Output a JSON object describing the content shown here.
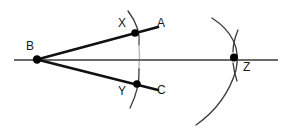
{
  "diagram": {
    "canvas": {
      "width": 286,
      "height": 130,
      "background": "#ffffff"
    },
    "colors": {
      "ray": "#111111",
      "baseline": "#6b6b6b",
      "arc": "#3a3a3a",
      "arc_faded": "#b4b4b4",
      "point": "#000000",
      "label": "#1a1a1a"
    },
    "labels": [
      {
        "id": "label-B",
        "text": "B",
        "x": 26,
        "y": 40
      },
      {
        "id": "label-X",
        "text": "X",
        "x": 118,
        "y": 17
      },
      {
        "id": "label-A",
        "text": "A",
        "x": 157,
        "y": 17
      },
      {
        "id": "label-Y",
        "text": "Y",
        "x": 118,
        "y": 85
      },
      {
        "id": "label-C",
        "text": "C",
        "x": 157,
        "y": 84
      },
      {
        "id": "label-Z",
        "text": "Z",
        "x": 243,
        "y": 61
      }
    ],
    "points": [
      {
        "id": "point-B",
        "name": "B",
        "x": 37,
        "y": 59.5,
        "r": 4.2
      },
      {
        "id": "point-X",
        "name": "X",
        "x": 135,
        "y": 33,
        "r": 3.8
      },
      {
        "id": "point-Y",
        "name": "Y",
        "x": 137,
        "y": 84,
        "r": 3.8
      },
      {
        "id": "point-Z",
        "name": "Z",
        "x": 234,
        "y": 57.5,
        "r": 4.0
      }
    ],
    "segments": [
      {
        "id": "baseline",
        "name": "horizontal-baseline",
        "x1": 14,
        "y1": 60,
        "x2": 278,
        "y2": 60,
        "width": 2.0,
        "color": "#6b6b6b"
      },
      {
        "id": "ray-BA",
        "name": "ray-B-to-A",
        "x1": 37,
        "y1": 59.5,
        "x2": 158,
        "y2": 27,
        "width": 2.6,
        "color": "#111111"
      },
      {
        "id": "ray-BC",
        "name": "ray-B-to-C",
        "x1": 37,
        "y1": 59.5,
        "x2": 158,
        "y2": 90,
        "width": 2.6,
        "color": "#111111"
      }
    ],
    "arcs": [
      {
        "id": "arc-XY-upper",
        "name": "compass-arc-through-X-upper",
        "d": "M 128 11 Q 141 28 139 45",
        "width": 1.3,
        "color": "#3a3a3a"
      },
      {
        "id": "arc-XY-middle",
        "name": "compass-arc-through-X-Y-faded",
        "d": "M 139 45 Q 140 56 139 69",
        "width": 1.3,
        "color": "#b4b4b4"
      },
      {
        "id": "arc-XY-lower",
        "name": "compass-arc-through-Y-lower",
        "d": "M 139 69 Q 140 88 130 108",
        "width": 1.3,
        "color": "#3a3a3a"
      },
      {
        "id": "arc-Z-large",
        "name": "compass-arc-large-through-Z",
        "d": "M 212 18 Q 243 38 236 70 Q 226 104 196 125",
        "width": 1.3,
        "color": "#3a3a3a"
      },
      {
        "id": "arc-Z-short-upper",
        "name": "compass-arc-short-through-Z-upper",
        "d": "M 238 30 Q 233 42 233 52",
        "width": 1.3,
        "color": "#3a3a3a"
      },
      {
        "id": "arc-Z-short-lower",
        "name": "compass-arc-short-through-Z-lower",
        "d": "M 233 63 Q 234 72 237 81",
        "width": 1.3,
        "color": "#3a3a3a"
      }
    ]
  }
}
